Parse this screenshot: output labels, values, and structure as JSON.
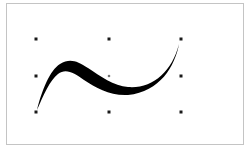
{
  "canvas": {
    "border_color": "#c4c4c4",
    "background": "#ffffff"
  },
  "shape": {
    "type": "brush-stroke-curve",
    "fill": "#000000",
    "selected": true
  },
  "selection": {
    "handle_color": "#1a1a1a",
    "center_color": "#777777",
    "bounding_box": {
      "left": 36,
      "top": 39,
      "right": 181,
      "bottom": 112
    },
    "handles": [
      {
        "name": "top-left",
        "x": 36,
        "y": 39
      },
      {
        "name": "top-center",
        "x": 109,
        "y": 39
      },
      {
        "name": "top-right",
        "x": 181,
        "y": 39
      },
      {
        "name": "middle-left",
        "x": 36,
        "y": 76
      },
      {
        "name": "middle-right",
        "x": 181,
        "y": 76
      },
      {
        "name": "bottom-left",
        "x": 36,
        "y": 112
      },
      {
        "name": "bottom-center",
        "x": 109,
        "y": 112
      },
      {
        "name": "bottom-right",
        "x": 181,
        "y": 112
      }
    ],
    "center": {
      "x": 109,
      "y": 76
    }
  }
}
